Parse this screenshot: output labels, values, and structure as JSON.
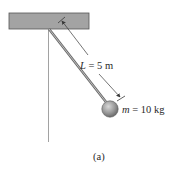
{
  "figure": {
    "caption": "(a)",
    "length_label": {
      "symbol": "L",
      "equals": " = ",
      "value": "5 m"
    },
    "mass_label": {
      "symbol": "m",
      "equals": " = ",
      "value": "10 kg"
    }
  },
  "colors": {
    "ceiling_fill": "#a3a3a3",
    "ceiling_stroke": "#555555",
    "rod": "#7a7a7a",
    "bob": "#9a9a9a",
    "reference_line": "#8a8a8a",
    "dimension_line": "#3a3a3a",
    "text": "#2a2a2a"
  }
}
